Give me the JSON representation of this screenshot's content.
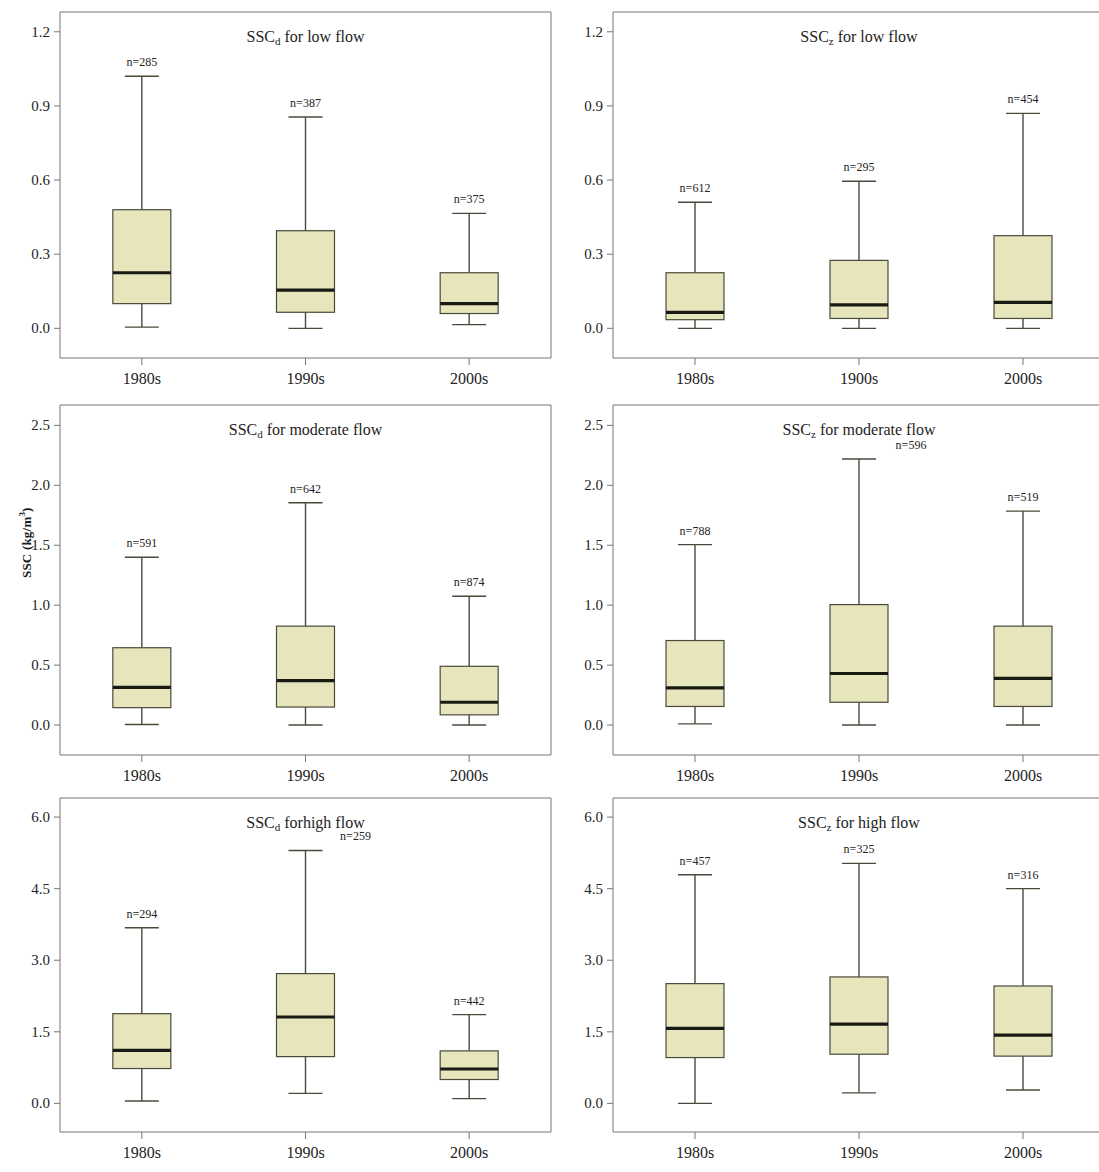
{
  "figure": {
    "axis_label_y": "SSC (kg/m",
    "axis_label_y_sup": "3",
    "axis_label_y_tail": ")",
    "box_fill": "#e6e5bc",
    "box_stroke": "#4a4a3c",
    "frame_stroke": "#777777",
    "text_color": "#242424"
  },
  "chart_data": [
    {
      "id": "sscd-low-flow",
      "type": "box",
      "title": "SSCd for low flow",
      "title_main": "SSC",
      "title_sub": "d",
      "title_rest": " for low flow",
      "xlabel": "",
      "ylabel": "SSC (kg/m3)",
      "ylim": [
        -0.12,
        1.28
      ],
      "yticks": [
        0.0,
        0.3,
        0.6,
        0.9,
        1.2
      ],
      "ytick_labels": [
        "0.0",
        "0.3",
        "0.6",
        "0.9",
        "1.2"
      ],
      "categories": [
        "1980s",
        "1990s",
        "2000s"
      ],
      "boxes": [
        {
          "category": "1980s",
          "n_label": "n=285",
          "whisker_low": 0.005,
          "q1": 0.1,
          "median": 0.225,
          "q3": 0.48,
          "whisker_high": 1.02,
          "n_offset": 0
        },
        {
          "category": "1990s",
          "n_label": "n=387",
          "whisker_low": 0.0,
          "q1": 0.065,
          "median": 0.155,
          "q3": 0.395,
          "whisker_high": 0.855,
          "n_offset": 0
        },
        {
          "category": "2000s",
          "n_label": "n=375",
          "whisker_low": 0.015,
          "q1": 0.06,
          "median": 0.1,
          "q3": 0.225,
          "whisker_high": 0.465,
          "n_offset": 0
        }
      ]
    },
    {
      "id": "sscz-low-flow",
      "type": "box",
      "title": "SSCz for low flow",
      "title_main": "SSC",
      "title_sub": "z",
      "title_rest": " for low flow",
      "xlabel": "",
      "ylabel": "SSC (kg/m3)",
      "ylim": [
        -0.12,
        1.28
      ],
      "yticks": [
        0.0,
        0.3,
        0.6,
        0.9,
        1.2
      ],
      "ytick_labels": [
        "0.0",
        "0.3",
        "0.6",
        "0.9",
        "1.2"
      ],
      "categories": [
        "1980s",
        "1900s",
        "2000s"
      ],
      "boxes": [
        {
          "category": "1980s",
          "n_label": "n=612",
          "whisker_low": 0.0,
          "q1": 0.035,
          "median": 0.065,
          "q3": 0.225,
          "whisker_high": 0.51,
          "n_offset": 0
        },
        {
          "category": "1900s",
          "n_label": "n=295",
          "whisker_low": 0.0,
          "q1": 0.04,
          "median": 0.095,
          "q3": 0.275,
          "whisker_high": 0.595,
          "n_offset": 0
        },
        {
          "category": "2000s",
          "n_label": "n=454",
          "whisker_low": 0.0,
          "q1": 0.04,
          "median": 0.105,
          "q3": 0.375,
          "whisker_high": 0.87,
          "n_offset": 0
        }
      ]
    },
    {
      "id": "sscd-moderate-flow",
      "type": "box",
      "title": "SSCd for moderate flow",
      "title_main": "SSC",
      "title_sub": "d",
      "title_rest": " for moderate flow",
      "xlabel": "",
      "ylabel": "SSC (kg/m3)",
      "ylim": [
        -0.25,
        2.67
      ],
      "yticks": [
        0.0,
        0.5,
        1.0,
        1.5,
        2.0,
        2.5
      ],
      "ytick_labels": [
        "0.0",
        "0.5",
        "1.0",
        "1.5",
        "2.0",
        "2.5"
      ],
      "categories": [
        "1980s",
        "1990s",
        "2000s"
      ],
      "boxes": [
        {
          "category": "1980s",
          "n_label": "n=591",
          "whisker_low": 0.005,
          "q1": 0.145,
          "median": 0.315,
          "q3": 0.645,
          "whisker_high": 1.4,
          "n_offset": 0
        },
        {
          "category": "1990s",
          "n_label": "n=642",
          "whisker_low": 0.0,
          "q1": 0.15,
          "median": 0.37,
          "q3": 0.825,
          "whisker_high": 1.855,
          "n_offset": 0
        },
        {
          "category": "2000s",
          "n_label": "n=874",
          "whisker_low": 0.0,
          "q1": 0.085,
          "median": 0.19,
          "q3": 0.49,
          "whisker_high": 1.075,
          "n_offset": 0
        }
      ]
    },
    {
      "id": "sscz-moderate-flow",
      "type": "box",
      "title": "SSCz for moderate flow",
      "title_main": "SSC",
      "title_sub": "z",
      "title_rest": " for moderate flow",
      "xlabel": "",
      "ylabel": "SSC (kg/m3)",
      "ylim": [
        -0.25,
        2.67
      ],
      "yticks": [
        0.0,
        0.5,
        1.0,
        1.5,
        2.0,
        2.5
      ],
      "ytick_labels": [
        "0.0",
        "0.5",
        "1.0",
        "1.5",
        "2.0",
        "2.5"
      ],
      "categories": [
        "1980s",
        "1990s",
        "2000s"
      ],
      "boxes": [
        {
          "category": "1980s",
          "n_label": "n=788",
          "whisker_low": 0.01,
          "q1": 0.155,
          "median": 0.31,
          "q3": 0.705,
          "whisker_high": 1.505,
          "n_offset": 0
        },
        {
          "category": "1990s",
          "n_label": "n=596",
          "whisker_low": 0.0,
          "q1": 0.19,
          "median": 0.43,
          "q3": 1.005,
          "whisker_high": 2.22,
          "n_offset": 52
        },
        {
          "category": "2000s",
          "n_label": "n=519",
          "whisker_low": 0.0,
          "q1": 0.155,
          "median": 0.39,
          "q3": 0.825,
          "whisker_high": 1.785,
          "n_offset": 0
        }
      ]
    },
    {
      "id": "sscd-high-flow",
      "type": "box",
      "title": "SSCd for high flow",
      "title_main": "SSC",
      "title_sub": "d",
      "title_rest": " forhigh flow",
      "xlabel": "",
      "ylabel": "SSC (kg/m3)",
      "ylim": [
        -0.6,
        6.4
      ],
      "yticks": [
        0.0,
        1.5,
        3.0,
        4.5,
        6.0
      ],
      "ytick_labels": [
        "0.0",
        "1.5",
        "3.0",
        "4.5",
        "6.0"
      ],
      "categories": [
        "1980s",
        "1990s",
        "2000s"
      ],
      "boxes": [
        {
          "category": "1980s",
          "n_label": "n=294",
          "whisker_low": 0.05,
          "q1": 0.73,
          "median": 1.11,
          "q3": 1.88,
          "whisker_high": 3.68,
          "n_offset": 0
        },
        {
          "category": "1990s",
          "n_label": "n=259",
          "whisker_low": 0.21,
          "q1": 0.98,
          "median": 1.81,
          "q3": 2.72,
          "whisker_high": 5.3,
          "n_offset": 50
        },
        {
          "category": "2000s",
          "n_label": "n=442",
          "whisker_low": 0.1,
          "q1": 0.5,
          "median": 0.72,
          "q3": 1.1,
          "whisker_high": 1.86,
          "n_offset": 0
        }
      ]
    },
    {
      "id": "sscz-high-flow",
      "type": "box",
      "title": "SSCz for high flow",
      "title_main": "SSC",
      "title_sub": "z",
      "title_rest": " for high flow",
      "xlabel": "",
      "ylabel": "SSC (kg/m3)",
      "ylim": [
        -0.6,
        6.4
      ],
      "yticks": [
        0.0,
        1.5,
        3.0,
        4.5,
        6.0
      ],
      "ytick_labels": [
        "0.0",
        "1.5",
        "3.0",
        "4.5",
        "6.0"
      ],
      "categories": [
        "1980s",
        "1990s",
        "2000s"
      ],
      "boxes": [
        {
          "category": "1980s",
          "n_label": "n=457",
          "whisker_low": 0.0,
          "q1": 0.96,
          "median": 1.57,
          "q3": 2.51,
          "whisker_high": 4.79,
          "n_offset": 0
        },
        {
          "category": "1990s",
          "n_label": "n=325",
          "whisker_low": 0.22,
          "q1": 1.03,
          "median": 1.66,
          "q3": 2.65,
          "whisker_high": 5.03,
          "n_offset": 0
        },
        {
          "category": "2000s",
          "n_label": "n=316",
          "whisker_low": 0.28,
          "q1": 0.99,
          "median": 1.43,
          "q3": 2.46,
          "whisker_high": 4.5,
          "n_offset": 0
        }
      ]
    }
  ]
}
